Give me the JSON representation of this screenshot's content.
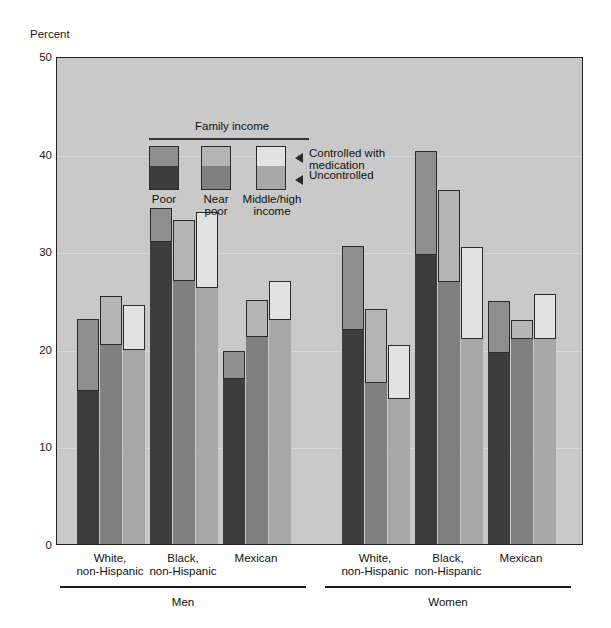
{
  "chart_data": {
    "type": "bar",
    "title": "",
    "ylabel": "Percent",
    "xlabel": "",
    "ylim": [
      0,
      50
    ],
    "yticks": [
      0,
      10,
      20,
      30,
      40,
      50
    ],
    "grid": true,
    "legend": {
      "title": "Family income",
      "position": "inside-top-left",
      "series": [
        {
          "name": "Poor",
          "label_lines": [
            "Poor"
          ],
          "color_uncontrolled": "#3d3d3d",
          "color_controlled": "#8e8e8e"
        },
        {
          "name": "Near poor",
          "label_lines": [
            "Near",
            "poor"
          ],
          "color_uncontrolled": "#808080",
          "color_controlled": "#b5b5b5"
        },
        {
          "name": "Middle/high income",
          "label_lines": [
            "Middle/high",
            "income"
          ],
          "color_uncontrolled": "#a8a8a8",
          "color_controlled": "#e2e2e2"
        }
      ],
      "annotations": [
        {
          "text_lines": [
            "Controlled with",
            "medication"
          ],
          "points_to": "top-segment"
        },
        {
          "text_lines": [
            "Uncontrolled"
          ],
          "points_to": "bottom-segment"
        }
      ]
    },
    "stack_parts": [
      "Uncontrolled",
      "Controlled with medication"
    ],
    "supergroups": [
      {
        "label": "Men",
        "groups": [
          {
            "label_lines": [
              "White,",
              "non-Hispanic"
            ],
            "bars": [
              {
                "series": "Poor",
                "uncontrolled": 15.7,
                "total": 23.1
              },
              {
                "series": "Near poor",
                "uncontrolled": 20.4,
                "total": 25.4
              },
              {
                "series": "Middle/high income",
                "uncontrolled": 19.9,
                "total": 24.5
              }
            ]
          },
          {
            "label_lines": [
              "Black,",
              "non-Hispanic"
            ],
            "bars": [
              {
                "series": "Poor",
                "uncontrolled": 30.9,
                "total": 34.4
              },
              {
                "series": "Near poor",
                "uncontrolled": 26.9,
                "total": 33.2
              },
              {
                "series": "Middle/high income",
                "uncontrolled": 26.2,
                "total": 34.0
              }
            ]
          },
          {
            "label_lines": [
              "Mexican"
            ],
            "bars": [
              {
                "series": "Poor",
                "uncontrolled": 16.9,
                "total": 19.8
              },
              {
                "series": "Near poor",
                "uncontrolled": 21.2,
                "total": 25.0
              },
              {
                "series": "Middle/high income",
                "uncontrolled": 23.0,
                "total": 26.9
              }
            ]
          }
        ]
      },
      {
        "label": "Women",
        "groups": [
          {
            "label_lines": [
              "White,",
              "non-Hispanic"
            ],
            "bars": [
              {
                "series": "Poor",
                "uncontrolled": 21.9,
                "total": 30.5
              },
              {
                "series": "Near poor",
                "uncontrolled": 16.5,
                "total": 24.1
              },
              {
                "series": "Middle/high income",
                "uncontrolled": 14.9,
                "total": 20.4
              }
            ]
          },
          {
            "label_lines": [
              "Black,",
              "non-Hispanic"
            ],
            "bars": [
              {
                "series": "Poor",
                "uncontrolled": 29.6,
                "total": 40.3
              },
              {
                "series": "Near poor",
                "uncontrolled": 26.8,
                "total": 36.3
              },
              {
                "series": "Middle/high income",
                "uncontrolled": 21.0,
                "total": 30.4
              }
            ]
          },
          {
            "label_lines": [
              "Mexican"
            ],
            "bars": [
              {
                "series": "Poor",
                "uncontrolled": 19.6,
                "total": 24.9
              },
              {
                "series": "Near poor",
                "uncontrolled": 21.0,
                "total": 23.0
              },
              {
                "series": "Middle/high income",
                "uncontrolled": 21.0,
                "total": 25.6
              }
            ]
          }
        ]
      }
    ]
  },
  "axis": {
    "y_label": "Percent",
    "y_ticks": [
      "50",
      "40",
      "30",
      "20",
      "10",
      "0"
    ]
  },
  "legend": {
    "title": "Family income",
    "items": [
      {
        "line1": "Poor",
        "line2": ""
      },
      {
        "line1": "Near",
        "line2": "poor"
      },
      {
        "line1": "Middle/high",
        "line2": "income"
      }
    ],
    "note_controlled_1": "Controlled with",
    "note_controlled_2": "medication",
    "note_uncontrolled": "Uncontrolled"
  },
  "xaxis": {
    "groups": [
      {
        "line1": "White,",
        "line2": "non-Hispanic"
      },
      {
        "line1": "Black,",
        "line2": "non-Hispanic"
      },
      {
        "line1": "Mexican",
        "line2": ""
      },
      {
        "line1": "White,",
        "line2": "non-Hispanic"
      },
      {
        "line1": "Black,",
        "line2": "non-Hispanic"
      },
      {
        "line1": "Mexican",
        "line2": ""
      }
    ],
    "supergroups": [
      {
        "label": "Men"
      },
      {
        "label": "Women"
      }
    ]
  },
  "colors": {
    "plot_bg": "#c9c9c9",
    "poor_uncontrolled": "#3d3d3d",
    "poor_controlled": "#8e8e8e",
    "nearpoor_uncontrolled": "#808080",
    "nearpoor_controlled": "#b5b5b5",
    "middle_uncontrolled": "#a8a8a8",
    "middle_controlled": "#e2e2e2",
    "outline": "#2a2a2a"
  }
}
